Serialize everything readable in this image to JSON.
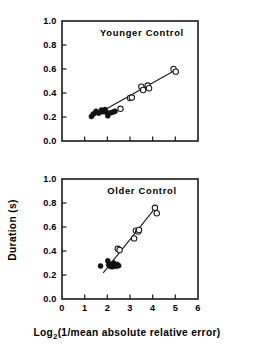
{
  "figure": {
    "y_axis_label": "Duration (s)",
    "x_axis_label_main": "Log",
    "x_axis_label_sub": "2",
    "x_axis_label_rest": "(1/mean absolute relative error)",
    "x_axis_label_full": "Log2(1/mean absolute relative error)"
  },
  "chart_data": [
    {
      "type": "scatter",
      "title": "Younger Control",
      "panel": "top",
      "xlabel": "Log2(1/mean absolute relative error)",
      "ylabel": "Duration (s)",
      "xlim": [
        0,
        6
      ],
      "ylim": [
        0.0,
        1.0
      ],
      "xticks": [
        0,
        1,
        2,
        3,
        4,
        5,
        6
      ],
      "xticklabels": [
        "",
        "",
        "",
        "",
        "",
        "",
        ""
      ],
      "yticks": [
        0.0,
        0.2,
        0.4,
        0.6,
        0.8,
        1.0
      ],
      "yticklabels": [
        "0.0",
        "0.2",
        "0.4",
        "0.6",
        "0.8",
        "1.0"
      ],
      "grid": false,
      "legend": null,
      "series": [
        {
          "name": "filled",
          "marker": "filled-circle",
          "points": [
            {
              "x": 1.3,
              "y": 0.205
            },
            {
              "x": 1.38,
              "y": 0.225
            },
            {
              "x": 1.5,
              "y": 0.247
            },
            {
              "x": 1.62,
              "y": 0.232
            },
            {
              "x": 1.74,
              "y": 0.258
            },
            {
              "x": 1.8,
              "y": 0.243
            },
            {
              "x": 1.9,
              "y": 0.262
            },
            {
              "x": 1.96,
              "y": 0.24
            },
            {
              "x": 2.02,
              "y": 0.21
            },
            {
              "x": 2.16,
              "y": 0.236
            },
            {
              "x": 2.26,
              "y": 0.242
            },
            {
              "x": 2.34,
              "y": 0.248
            }
          ]
        },
        {
          "name": "open",
          "marker": "open-circle",
          "points": [
            {
              "x": 2.58,
              "y": 0.268
            },
            {
              "x": 3.0,
              "y": 0.358
            },
            {
              "x": 3.08,
              "y": 0.362
            },
            {
              "x": 3.5,
              "y": 0.452
            },
            {
              "x": 3.58,
              "y": 0.425
            },
            {
              "x": 3.78,
              "y": 0.462
            },
            {
              "x": 3.84,
              "y": 0.44
            },
            {
              "x": 4.92,
              "y": 0.6
            },
            {
              "x": 5.02,
              "y": 0.578
            }
          ]
        }
      ],
      "fit_line": {
        "x0": 1.28,
        "y0": 0.196,
        "x1": 5.05,
        "y1": 0.595
      }
    },
    {
      "type": "scatter",
      "title": "Older Control",
      "panel": "bottom",
      "xlabel": "Log2(1/mean absolute relative error)",
      "ylabel": "Duration (s)",
      "xlim": [
        0,
        6
      ],
      "ylim": [
        0.0,
        1.0
      ],
      "xticks": [
        0,
        1,
        2,
        3,
        4,
        5,
        6
      ],
      "xticklabels": [
        "0",
        "1",
        "2",
        "3",
        "4",
        "5",
        "6"
      ],
      "yticks": [
        0.0,
        0.2,
        0.4,
        0.6,
        0.8,
        1.0
      ],
      "yticklabels": [
        "0.0",
        "0.2",
        "0.4",
        "0.6",
        "0.8",
        "1.0"
      ],
      "grid": false,
      "legend": null,
      "series": [
        {
          "name": "filled",
          "marker": "filled-circle",
          "points": [
            {
              "x": 1.7,
              "y": 0.275
            },
            {
              "x": 2.02,
              "y": 0.318
            },
            {
              "x": 2.06,
              "y": 0.285
            },
            {
              "x": 2.12,
              "y": 0.272
            },
            {
              "x": 2.18,
              "y": 0.29
            },
            {
              "x": 2.22,
              "y": 0.268
            },
            {
              "x": 2.28,
              "y": 0.3
            },
            {
              "x": 2.32,
              "y": 0.282
            },
            {
              "x": 2.38,
              "y": 0.272
            },
            {
              "x": 2.44,
              "y": 0.288
            },
            {
              "x": 2.5,
              "y": 0.278
            }
          ]
        },
        {
          "name": "open",
          "marker": "open-circle",
          "points": [
            {
              "x": 2.46,
              "y": 0.418
            },
            {
              "x": 2.54,
              "y": 0.408
            },
            {
              "x": 3.18,
              "y": 0.505
            },
            {
              "x": 3.26,
              "y": 0.57
            },
            {
              "x": 3.36,
              "y": 0.562
            },
            {
              "x": 3.4,
              "y": 0.575
            },
            {
              "x": 4.1,
              "y": 0.76
            },
            {
              "x": 4.18,
              "y": 0.715
            }
          ]
        }
      ],
      "fit_line": {
        "x0": 1.82,
        "y0": 0.218,
        "x1": 4.16,
        "y1": 0.77
      }
    }
  ]
}
